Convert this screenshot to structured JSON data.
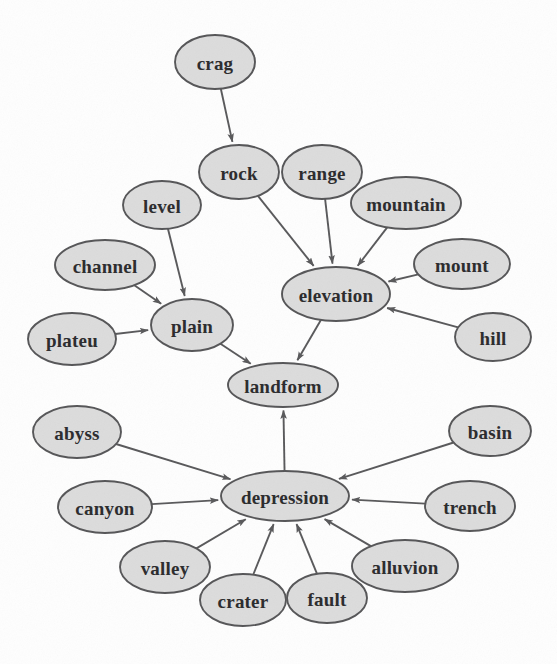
{
  "figure": {
    "width": 557,
    "height": 664,
    "background_color": "#fefefe",
    "node_fill_color": "#dcdcdc",
    "node_stroke_color": "#555557",
    "edge_color": "#58585a",
    "label_color": "#2a2a2c"
  },
  "graph": {
    "type": "directed-graph",
    "node_count": 21,
    "edge_count": 20,
    "nodes": [
      {
        "id": "crag",
        "label": "crag",
        "cx": 215,
        "cy": 62,
        "rx": 40,
        "ry": 27,
        "font_size": 19
      },
      {
        "id": "rock",
        "label": "rock",
        "cx": 239,
        "cy": 172,
        "rx": 40,
        "ry": 27,
        "font_size": 19
      },
      {
        "id": "range",
        "label": "range",
        "cx": 322,
        "cy": 172,
        "rx": 40,
        "ry": 27,
        "font_size": 19
      },
      {
        "id": "mountain",
        "label": "mountain",
        "cx": 406,
        "cy": 203,
        "rx": 55,
        "ry": 26,
        "font_size": 19
      },
      {
        "id": "level",
        "label": "level",
        "cx": 162,
        "cy": 205,
        "rx": 39,
        "ry": 24,
        "font_size": 19
      },
      {
        "id": "channel",
        "label": "channel",
        "cx": 105,
        "cy": 265,
        "rx": 50,
        "ry": 25,
        "font_size": 19
      },
      {
        "id": "mount",
        "label": "mount",
        "cx": 462,
        "cy": 264,
        "rx": 48,
        "ry": 25,
        "font_size": 19
      },
      {
        "id": "plateu",
        "label": "plateu",
        "cx": 72,
        "cy": 339,
        "rx": 44,
        "ry": 26,
        "font_size": 19
      },
      {
        "id": "plain",
        "label": "plain",
        "cx": 192,
        "cy": 325,
        "rx": 41,
        "ry": 26,
        "font_size": 19
      },
      {
        "id": "elevation",
        "label": "elevation",
        "cx": 336,
        "cy": 294,
        "rx": 54,
        "ry": 27,
        "font_size": 19
      },
      {
        "id": "hill",
        "label": "hill",
        "cx": 493,
        "cy": 337,
        "rx": 38,
        "ry": 24,
        "font_size": 19
      },
      {
        "id": "landform",
        "label": "landform",
        "cx": 283,
        "cy": 385,
        "rx": 55,
        "ry": 22,
        "font_size": 19
      },
      {
        "id": "abyss",
        "label": "abyss",
        "cx": 77,
        "cy": 432,
        "rx": 44,
        "ry": 26,
        "font_size": 19
      },
      {
        "id": "basin",
        "label": "basin",
        "cx": 490,
        "cy": 431,
        "rx": 41,
        "ry": 25,
        "font_size": 19
      },
      {
        "id": "canyon",
        "label": "canyon",
        "cx": 105,
        "cy": 507,
        "rx": 47,
        "ry": 26,
        "font_size": 19
      },
      {
        "id": "depression",
        "label": "depression",
        "cx": 285,
        "cy": 496,
        "rx": 64,
        "ry": 25,
        "font_size": 19
      },
      {
        "id": "trench",
        "label": "trench",
        "cx": 470,
        "cy": 506,
        "rx": 45,
        "ry": 25,
        "font_size": 19
      },
      {
        "id": "valley",
        "label": "valley",
        "cx": 165,
        "cy": 567,
        "rx": 45,
        "ry": 26,
        "font_size": 19
      },
      {
        "id": "crater",
        "label": "crater",
        "cx": 243,
        "cy": 600,
        "rx": 43,
        "ry": 26,
        "font_size": 19
      },
      {
        "id": "fault",
        "label": "fault",
        "cx": 327,
        "cy": 598,
        "rx": 40,
        "ry": 25,
        "font_size": 19
      },
      {
        "id": "alluvion",
        "label": "alluvion",
        "cx": 405,
        "cy": 566,
        "rx": 53,
        "ry": 26,
        "font_size": 19
      }
    ],
    "edges": [
      {
        "from": "crag",
        "to": "rock"
      },
      {
        "from": "rock",
        "to": "elevation"
      },
      {
        "from": "range",
        "to": "elevation"
      },
      {
        "from": "mountain",
        "to": "elevation"
      },
      {
        "from": "mount",
        "to": "elevation"
      },
      {
        "from": "hill",
        "to": "elevation"
      },
      {
        "from": "level",
        "to": "plain"
      },
      {
        "from": "channel",
        "to": "plain"
      },
      {
        "from": "plateu",
        "to": "plain"
      },
      {
        "from": "plain",
        "to": "landform"
      },
      {
        "from": "elevation",
        "to": "landform"
      },
      {
        "from": "depression",
        "to": "landform"
      },
      {
        "from": "abyss",
        "to": "depression"
      },
      {
        "from": "canyon",
        "to": "depression"
      },
      {
        "from": "valley",
        "to": "depression"
      },
      {
        "from": "crater",
        "to": "depression"
      },
      {
        "from": "fault",
        "to": "depression"
      },
      {
        "from": "alluvion",
        "to": "depression"
      },
      {
        "from": "trench",
        "to": "depression"
      },
      {
        "from": "basin",
        "to": "depression"
      }
    ]
  }
}
